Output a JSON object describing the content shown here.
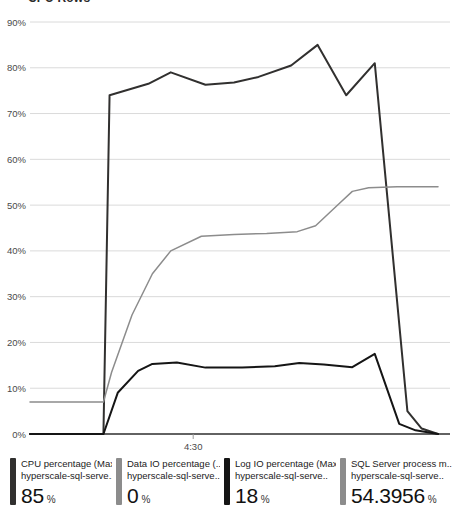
{
  "header": {
    "cropped_title": "CPU Rows"
  },
  "chart_data": {
    "type": "line",
    "title": "",
    "xlabel": "",
    "ylabel": "",
    "ylim": [
      0,
      90
    ],
    "yticks": [
      "0%",
      "10%",
      "20%",
      "30%",
      "40%",
      "50%",
      "60%",
      "70%",
      "80%",
      "90%"
    ],
    "ytick_values": [
      0,
      10,
      20,
      30,
      40,
      50,
      60,
      70,
      80,
      90
    ],
    "xticks": [
      "4:30"
    ],
    "xtick_positions": [
      0.4
    ],
    "grid": true,
    "legend_position": "bottom",
    "series": [
      {
        "name": "CPU percentage (Max)",
        "color": "#31302f",
        "points": [
          [
            0.0,
            0.0
          ],
          [
            0.18,
            0.0
          ],
          [
            0.195,
            74.0
          ],
          [
            0.29,
            76.5
          ],
          [
            0.345,
            79.0
          ],
          [
            0.43,
            76.3
          ],
          [
            0.5,
            76.8
          ],
          [
            0.56,
            78.0
          ],
          [
            0.64,
            80.5
          ],
          [
            0.705,
            85.0
          ],
          [
            0.775,
            74.0
          ],
          [
            0.845,
            81.0
          ],
          [
            0.925,
            5.0
          ],
          [
            0.96,
            1.2
          ],
          [
            1.0,
            0.0
          ]
        ]
      },
      {
        "name": "Data IO percentage (Max)",
        "color": "#8c8c8c",
        "points": [
          [
            0.0,
            7.0
          ],
          [
            0.18,
            7.0
          ],
          [
            0.2,
            13.5
          ],
          [
            0.25,
            26.0
          ],
          [
            0.3,
            35.0
          ],
          [
            0.345,
            40.0
          ],
          [
            0.42,
            43.2
          ],
          [
            0.5,
            43.6
          ],
          [
            0.58,
            43.8
          ],
          [
            0.655,
            44.2
          ],
          [
            0.7,
            45.5
          ],
          [
            0.76,
            50.5
          ],
          [
            0.79,
            53.0
          ],
          [
            0.83,
            53.8
          ],
          [
            0.9,
            54.0
          ],
          [
            1.0,
            54.0
          ]
        ]
      },
      {
        "name": "Log IO percentage (Max)",
        "color": "#151515",
        "points": [
          [
            0.0,
            0.0
          ],
          [
            0.18,
            0.0
          ],
          [
            0.215,
            9.0
          ],
          [
            0.265,
            13.8
          ],
          [
            0.3,
            15.3
          ],
          [
            0.36,
            15.6
          ],
          [
            0.43,
            14.5
          ],
          [
            0.52,
            14.5
          ],
          [
            0.6,
            14.8
          ],
          [
            0.66,
            15.5
          ],
          [
            0.72,
            15.2
          ],
          [
            0.79,
            14.6
          ],
          [
            0.845,
            17.5
          ],
          [
            0.905,
            2.2
          ],
          [
            0.945,
            0.8
          ],
          [
            1.0,
            0.0
          ]
        ]
      }
    ]
  },
  "legend": {
    "items": [
      {
        "metric": "CPU percentage (Max)",
        "resource": "hyperscale-sql-serve..",
        "value": "85",
        "unit": "%",
        "color": "#31302f"
      },
      {
        "metric": "Data IO percentage (..",
        "resource": "hyperscale-sql-serve..",
        "value": "0",
        "unit": "%",
        "color": "#8c8c8c"
      },
      {
        "metric": "Log IO percentage (Max)",
        "resource": "hyperscale-sql-serve..",
        "value": "18",
        "unit": "%",
        "color": "#151515"
      },
      {
        "metric": "SQL Server process m..",
        "resource": "hyperscale-sql-serve..",
        "value": "54.3956",
        "unit": "%",
        "color": "#8c8c8c"
      }
    ]
  }
}
